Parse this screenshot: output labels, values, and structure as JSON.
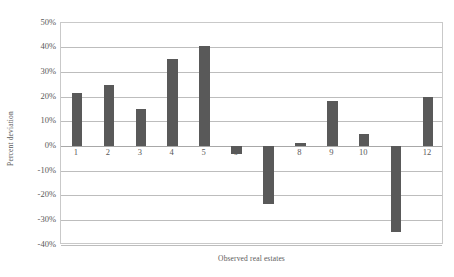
{
  "chart_data": {
    "type": "bar",
    "title": "",
    "xlabel": "Observed real estates",
    "ylabel": "Percent deviation",
    "categories": [
      "1",
      "2",
      "3",
      "4",
      "5",
      "6",
      "7",
      "8",
      "9",
      "10",
      "11",
      "12"
    ],
    "values": [
      21.8,
      24.7,
      15.3,
      35.3,
      40.6,
      -3.0,
      -23.5,
      1.5,
      18.2,
      5.1,
      -34.9,
      20.2
    ],
    "ylim": [
      -40,
      50
    ],
    "ytick_values": [
      50,
      40,
      30,
      20,
      10,
      0,
      -10,
      -20,
      -30,
      -40
    ],
    "ytick_labels": [
      "50%",
      "40%",
      "30%",
      "20%",
      "10%",
      "0%",
      "-10%",
      "-20%",
      "-30%",
      "-40%"
    ],
    "grid": true,
    "legend": false,
    "legend_position": "none",
    "bar_color": "#595959",
    "gridline_color": "#bdbdbd",
    "plot_border_color": "#c9c9c9",
    "axis_text_color": "#595959",
    "hidden_x_labels": [
      "7",
      "11"
    ]
  }
}
